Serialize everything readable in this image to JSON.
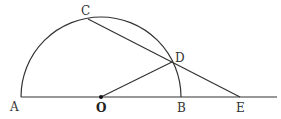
{
  "diagram": {
    "type": "geometry",
    "stroke_color": "#333333",
    "points": {
      "A": {
        "label": "A",
        "x": 21,
        "y": 97
      },
      "O": {
        "label": "O",
        "x": 101,
        "y": 97
      },
      "B": {
        "label": "B",
        "x": 181,
        "y": 97
      },
      "E": {
        "label": "E",
        "x": 240,
        "y": 97
      },
      "C": {
        "label": "C",
        "x": 88,
        "y": 19
      },
      "D": {
        "label": "D",
        "x": 172,
        "y": 62
      }
    },
    "segments": [
      "A-line-end",
      "C-E",
      "O-D"
    ],
    "arc": {
      "center": "O",
      "radius": 80,
      "from": "A",
      "to": "B"
    }
  }
}
